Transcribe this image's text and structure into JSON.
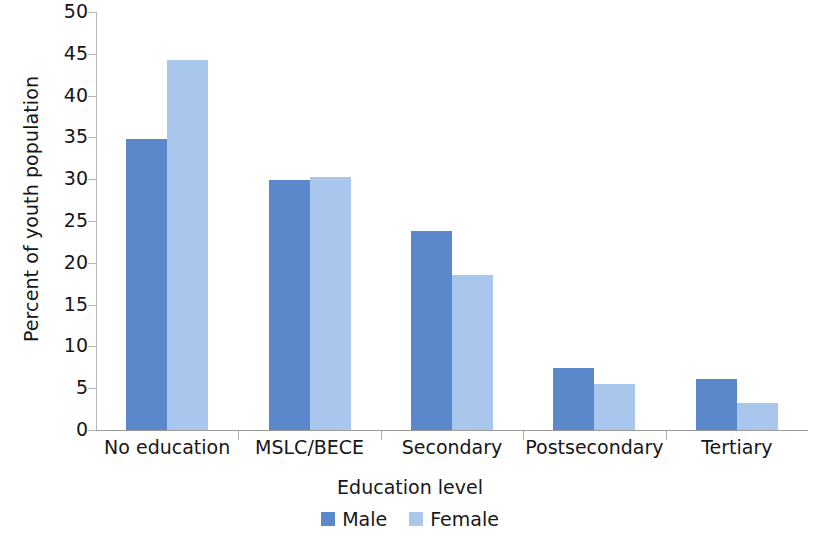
{
  "chart_data": {
    "type": "bar",
    "title": "",
    "xlabel": "Education level",
    "ylabel": "Percent of youth population",
    "categories": [
      "No education",
      "MSLC/BECE",
      "Secondary",
      "Postsecondary",
      "Tertiary"
    ],
    "series": [
      {
        "name": "Male",
        "color": "#5b87cb",
        "values": [
          34.8,
          29.9,
          23.8,
          7.4,
          6.1
        ]
      },
      {
        "name": "Female",
        "color": "#a9c6ec",
        "values": [
          44.3,
          30.3,
          18.5,
          5.5,
          3.2
        ]
      }
    ],
    "ylim": [
      0,
      50
    ],
    "ytick_step": 5,
    "ytick_labels": [
      "0",
      "5",
      "10",
      "15",
      "20",
      "25",
      "30",
      "35",
      "40",
      "45",
      "50"
    ],
    "grid": false,
    "legend_position": "bottom"
  },
  "axes": {
    "y_title": "Percent of youth population",
    "x_title": "Education level"
  },
  "legend": {
    "items": [
      {
        "label": "Male",
        "color": "#5b87cb"
      },
      {
        "label": "Female",
        "color": "#a9c6ec"
      }
    ]
  }
}
